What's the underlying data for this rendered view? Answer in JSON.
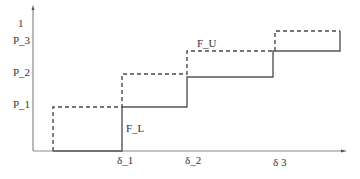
{
  "diagram": {
    "type": "step-function-bounds",
    "y_axis": {
      "ticks": [
        {
          "label": "1",
          "y": 20
        },
        {
          "label": "P_3",
          "y": 41
        },
        {
          "label": "P_2",
          "y": 73
        },
        {
          "label": "P_1",
          "y": 106
        }
      ]
    },
    "x_axis": {
      "ticks": [
        {
          "label": "δ_1",
          "x": 122
        },
        {
          "label": "δ_2",
          "x": 187
        },
        {
          "label": "δ 3",
          "x": 273
        }
      ]
    },
    "curves": [
      {
        "name": "F_U",
        "style": "dashed",
        "label": "F_U"
      },
      {
        "name": "F_L",
        "style": "solid",
        "label": "F_L"
      }
    ],
    "colors": {
      "axis": "#888888",
      "line": "#555555",
      "text": "#333333"
    }
  }
}
